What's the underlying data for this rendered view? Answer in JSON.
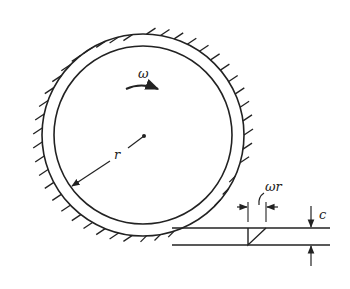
{
  "diagram": {
    "labels": {
      "omega": "ω",
      "radius": "r",
      "surface_speed": "ωr",
      "clearance": "c"
    },
    "geometry": {
      "center": [
        143,
        135
      ],
      "inner_radius": 89,
      "outer_radius": 101,
      "gap_line_top_y": 228,
      "gap_line_bottom_y": 245,
      "gap_line_x_start": 172,
      "gap_line_x_end": 330,
      "velocity_profile_x": 248,
      "clearance_arrow_x": 311
    },
    "colors": {
      "stroke": "#222222",
      "background": "#ffffff"
    }
  }
}
